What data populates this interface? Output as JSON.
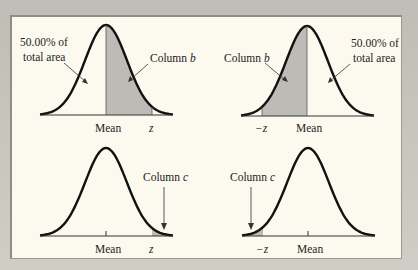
{
  "figure": {
    "panels": [
      {
        "id": "top-left",
        "shaded_region": "mean-to-z",
        "left_label_lines": [
          "50.00% of",
          "total area"
        ],
        "right_label": {
          "text": "Column ",
          "var": "b"
        },
        "axis_labels": {
          "mean": "Mean",
          "z": "z"
        }
      },
      {
        "id": "top-right",
        "shaded_region": "neg-z-to-mean",
        "left_label": {
          "text": "Column ",
          "var": "b"
        },
        "right_label_lines": [
          "50.00% of",
          "total area"
        ],
        "axis_labels": {
          "mean": "Mean",
          "z": "−z"
        }
      },
      {
        "id": "bottom-left",
        "shaded_region": "right-tail-beyond-z",
        "right_label": {
          "text": "Column ",
          "var": "c"
        },
        "axis_labels": {
          "mean": "Mean",
          "z": "z"
        }
      },
      {
        "id": "bottom-right",
        "shaded_region": "left-tail-beyond-neg-z",
        "left_label": {
          "text": "Column ",
          "var": "c"
        },
        "axis_labels": {
          "mean": "Mean",
          "z": "−z"
        }
      }
    ],
    "colors": {
      "curve": "#111111",
      "shade": "#bdbbb5",
      "panel_bg": "#fcf9ee",
      "frame": "#c9c7c0"
    }
  }
}
